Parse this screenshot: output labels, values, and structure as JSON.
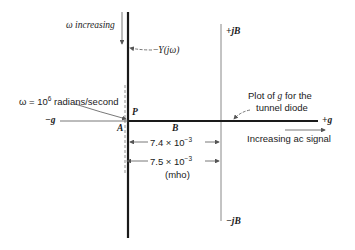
{
  "diagram": {
    "labels": {
      "omega_increasing": "ω increasing",
      "neg_Y_prefix": "−",
      "neg_Y": "Y(jω)",
      "plus_jB": "+jB",
      "minus_jB": "−jB",
      "omega_eq_prefix": "ω = 10",
      "omega_eq_exp": "6",
      "omega_eq_suffix": " radians/second",
      "P": "P",
      "A": "A",
      "B": "B",
      "minus_g": "−g",
      "plus_g": "+g",
      "plot_g_line1_a": "Plot of ",
      "plot_g_line1_g": "g",
      "plot_g_line1_b": " for the",
      "plot_g_line2": "tunnel diode",
      "increasing_ac": "Increasing ac signal",
      "dim1_mant": "7.4 × 10",
      "dim1_exp": "−3",
      "dim2_mant": "7.5 × 10",
      "dim2_exp": "−3",
      "unit": "(mho)"
    },
    "colors": {
      "ink": "#1a1a1a",
      "thin": "#777777"
    }
  }
}
